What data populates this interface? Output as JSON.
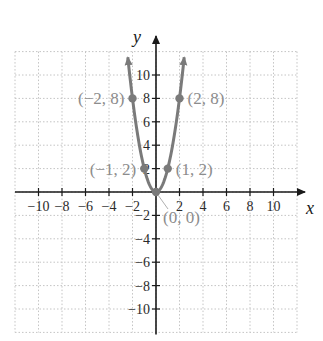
{
  "chart_data": {
    "type": "line",
    "title": "",
    "function": "y = 2x^2",
    "xlabel": "x",
    "ylabel": "y",
    "xlim": [
      -12,
      12
    ],
    "ylim": [
      -12,
      12
    ],
    "grid": true,
    "grid_style": "dotted",
    "x_ticks": [
      -10,
      -8,
      -6,
      -4,
      -2,
      2,
      4,
      6,
      8,
      10
    ],
    "x_tick_labels": [
      "−10",
      "−8",
      "−6",
      "−4",
      "−2",
      "2",
      "4",
      "6",
      "8",
      "10"
    ],
    "y_ticks": [
      10,
      8,
      6,
      4,
      2,
      -2,
      -4,
      -6,
      -8,
      -10
    ],
    "y_tick_labels": [
      "10",
      "8",
      "6",
      "4",
      "2",
      "−2",
      "−4",
      "−6",
      "−8",
      "−10"
    ],
    "series": [
      {
        "name": "parabola",
        "x": [
          -2.42,
          -2,
          -1,
          0,
          1,
          2,
          2.42
        ],
        "y": [
          11.7,
          8,
          2,
          0,
          2,
          8,
          11.7
        ],
        "color": "#7a7a7a",
        "arrows_at_ends": true
      }
    ],
    "points": [
      {
        "x": -2,
        "y": 8,
        "label": "(−2, 8)"
      },
      {
        "x": 2,
        "y": 8,
        "label": "(2, 8)"
      },
      {
        "x": -1,
        "y": 2,
        "label": "(−1, 2)"
      },
      {
        "x": 1,
        "y": 2,
        "label": "(1, 2)"
      },
      {
        "x": 0,
        "y": 0,
        "label": "(0, 0)"
      }
    ],
    "colors": {
      "curve": "#7a7a7a",
      "point_labels": "#8c8c8c",
      "axes": "#1a1a1a",
      "grid": "#c4c4c4"
    }
  }
}
